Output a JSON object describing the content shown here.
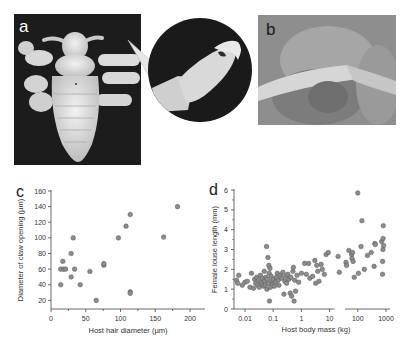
{
  "figure": {
    "panels": [
      {
        "letter": "a",
        "content": "scanning electron micrograph of louse, dorsal view, with magnified claw inset"
      },
      {
        "letter": "b",
        "content": "scanning electron micrograph of louse claw gripping host hair"
      },
      {
        "letter": "c",
        "content": "scatter plot: claw opening vs host hair diameter"
      },
      {
        "letter": "d",
        "content": "scatter plot: female louse length vs host body mass"
      }
    ]
  },
  "chart_data": [
    {
      "panel": "c",
      "type": "scatter",
      "title": "",
      "xlabel": "Host  hair diameter (µm)",
      "ylabel": "Diameter of claw opening (µm)",
      "xlim": [
        0,
        215
      ],
      "ylim": [
        0,
        160
      ],
      "xticks": [
        0,
        50,
        100,
        150,
        200
      ],
      "xtick_labels": [
        "0",
        "50",
        "100",
        "150",
        "200"
      ],
      "yticks": [
        20,
        40,
        60,
        80,
        100,
        120,
        140,
        160
      ],
      "ytick_labels": [
        "20",
        "40",
        "60",
        "80",
        "100",
        "120",
        "140",
        "160"
      ],
      "grid": false,
      "points": [
        {
          "x": 14,
          "y": 40
        },
        {
          "x": 14,
          "y": 60
        },
        {
          "x": 17,
          "y": 70
        },
        {
          "x": 18,
          "y": 60
        },
        {
          "x": 21,
          "y": 60
        },
        {
          "x": 29,
          "y": 80
        },
        {
          "x": 29,
          "y": 50
        },
        {
          "x": 32,
          "y": 100
        },
        {
          "x": 34,
          "y": 60
        },
        {
          "x": 42,
          "y": 40
        },
        {
          "x": 56,
          "y": 57
        },
        {
          "x": 65,
          "y": 20
        },
        {
          "x": 76,
          "y": 65
        },
        {
          "x": 76,
          "y": 67
        },
        {
          "x": 97,
          "y": 100
        },
        {
          "x": 108,
          "y": 115
        },
        {
          "x": 114,
          "y": 130
        },
        {
          "x": 114,
          "y": 31
        },
        {
          "x": 114,
          "y": 29
        },
        {
          "x": 162,
          "y": 101
        },
        {
          "x": 182,
          "y": 140
        }
      ]
    },
    {
      "panel": "d",
      "type": "scatter",
      "title": "",
      "xlabel": "Host  body mass (kg)",
      "ylabel": "Female louse length (mm)",
      "xscale": "log",
      "xlim": [
        0.005,
        1500
      ],
      "ylim": [
        0,
        6
      ],
      "xticks": [
        0.01,
        0.1,
        1,
        10,
        100,
        1000
      ],
      "xtick_labels": [
        "0.01",
        "0.1",
        "1",
        "10",
        "100",
        "1000"
      ],
      "yticks": [
        0,
        1,
        2,
        3,
        4,
        5,
        6
      ],
      "ytick_labels": [
        "0",
        "1",
        "2",
        "3",
        "4",
        "5",
        "6"
      ],
      "axis_break": [
        15,
        35
      ],
      "grid": false,
      "points": [
        {
          "x": 0.005,
          "y": 1.45
        },
        {
          "x": 0.0055,
          "y": 1.3
        },
        {
          "x": 0.006,
          "y": 1.7
        },
        {
          "x": 0.008,
          "y": 1.2
        },
        {
          "x": 0.01,
          "y": 1.35
        },
        {
          "x": 0.012,
          "y": 1.4
        },
        {
          "x": 0.015,
          "y": 1.1
        },
        {
          "x": 0.017,
          "y": 1.8
        },
        {
          "x": 0.02,
          "y": 1.05
        },
        {
          "x": 0.022,
          "y": 1.5
        },
        {
          "x": 0.024,
          "y": 1.3
        },
        {
          "x": 0.026,
          "y": 1.6
        },
        {
          "x": 0.028,
          "y": 1.2
        },
        {
          "x": 0.03,
          "y": 1.45
        },
        {
          "x": 0.032,
          "y": 1.1
        },
        {
          "x": 0.035,
          "y": 1.7
        },
        {
          "x": 0.037,
          "y": 1.35
        },
        {
          "x": 0.04,
          "y": 1.25
        },
        {
          "x": 0.042,
          "y": 1.55
        },
        {
          "x": 0.045,
          "y": 1.15
        },
        {
          "x": 0.048,
          "y": 1.9
        },
        {
          "x": 0.05,
          "y": 1.4
        },
        {
          "x": 0.052,
          "y": 1.2
        },
        {
          "x": 0.055,
          "y": 1.6
        },
        {
          "x": 0.058,
          "y": 3.15
        },
        {
          "x": 0.06,
          "y": 1.0
        },
        {
          "x": 0.062,
          "y": 1.5
        },
        {
          "x": 0.065,
          "y": 2.6
        },
        {
          "x": 0.067,
          "y": 1.3
        },
        {
          "x": 0.07,
          "y": 2.2
        },
        {
          "x": 0.072,
          "y": 1.8
        },
        {
          "x": 0.074,
          "y": 0.4
        },
        {
          "x": 0.077,
          "y": 2.05
        },
        {
          "x": 0.08,
          "y": 1.1
        },
        {
          "x": 0.085,
          "y": 1.65
        },
        {
          "x": 0.09,
          "y": 1.4
        },
        {
          "x": 0.095,
          "y": 1.25
        },
        {
          "x": 0.1,
          "y": 1.5
        },
        {
          "x": 0.11,
          "y": 1.15
        },
        {
          "x": 0.12,
          "y": 1.35
        },
        {
          "x": 0.13,
          "y": 1.6
        },
        {
          "x": 0.14,
          "y": 1.8
        },
        {
          "x": 0.15,
          "y": 1.45
        },
        {
          "x": 0.16,
          "y": 1.2
        },
        {
          "x": 0.18,
          "y": 1.7
        },
        {
          "x": 0.2,
          "y": 1.55
        },
        {
          "x": 0.22,
          "y": 1.85
        },
        {
          "x": 0.24,
          "y": 0.75
        },
        {
          "x": 0.26,
          "y": 1.4
        },
        {
          "x": 0.28,
          "y": 1.65
        },
        {
          "x": 0.3,
          "y": 1.3
        },
        {
          "x": 0.33,
          "y": 1.75
        },
        {
          "x": 0.36,
          "y": 1.5
        },
        {
          "x": 0.4,
          "y": 0.8
        },
        {
          "x": 0.42,
          "y": 1.6
        },
        {
          "x": 0.45,
          "y": 0.65
        },
        {
          "x": 0.5,
          "y": 1.9
        },
        {
          "x": 0.52,
          "y": 2.1
        },
        {
          "x": 0.55,
          "y": 0.4
        },
        {
          "x": 0.58,
          "y": 1.45
        },
        {
          "x": 0.62,
          "y": 0.9
        },
        {
          "x": 0.7,
          "y": 1.7
        },
        {
          "x": 0.8,
          "y": 1.35
        },
        {
          "x": 1.0,
          "y": 1.8
        },
        {
          "x": 1.3,
          "y": 2.3
        },
        {
          "x": 1.5,
          "y": 1.75
        },
        {
          "x": 1.8,
          "y": 2.3
        },
        {
          "x": 2.0,
          "y": 1.55
        },
        {
          "x": 2.5,
          "y": 1.65
        },
        {
          "x": 3.0,
          "y": 2.45
        },
        {
          "x": 3.2,
          "y": 1.3
        },
        {
          "x": 3.5,
          "y": 2.2
        },
        {
          "x": 3.8,
          "y": 1.9
        },
        {
          "x": 4.2,
          "y": 1.4
        },
        {
          "x": 5.0,
          "y": 2.25
        },
        {
          "x": 5.5,
          "y": 2.0
        },
        {
          "x": 6.5,
          "y": 1.75
        },
        {
          "x": 7.5,
          "y": 2.75
        },
        {
          "x": 9.0,
          "y": 2.85
        },
        {
          "x": 20,
          "y": 2.65
        },
        {
          "x": 22,
          "y": 1.85
        },
        {
          "x": 38,
          "y": 2.35
        },
        {
          "x": 40,
          "y": 2.2
        },
        {
          "x": 48,
          "y": 2.95
        },
        {
          "x": 60,
          "y": 2.75
        },
        {
          "x": 62,
          "y": 2.55
        },
        {
          "x": 65,
          "y": 2.85
        },
        {
          "x": 68,
          "y": 2.4
        },
        {
          "x": 75,
          "y": 1.6
        },
        {
          "x": 100,
          "y": 5.85
        },
        {
          "x": 105,
          "y": 1.8
        },
        {
          "x": 130,
          "y": 3.15
        },
        {
          "x": 140,
          "y": 4.45
        },
        {
          "x": 170,
          "y": 2.0
        },
        {
          "x": 220,
          "y": 2.7
        },
        {
          "x": 300,
          "y": 2.85
        },
        {
          "x": 380,
          "y": 2.15
        },
        {
          "x": 400,
          "y": 3.3
        },
        {
          "x": 420,
          "y": 3.25
        },
        {
          "x": 700,
          "y": 3.4
        },
        {
          "x": 750,
          "y": 1.75
        },
        {
          "x": 760,
          "y": 2.4
        },
        {
          "x": 780,
          "y": 3.0
        },
        {
          "x": 790,
          "y": 3.55
        },
        {
          "x": 800,
          "y": 4.2
        },
        {
          "x": 820,
          "y": 3.2
        }
      ]
    }
  ],
  "colors": {
    "marker_fill": "#8c8c8c",
    "marker_edge": "#5a5a5a",
    "axis": "#444444",
    "text": "#333333"
  }
}
